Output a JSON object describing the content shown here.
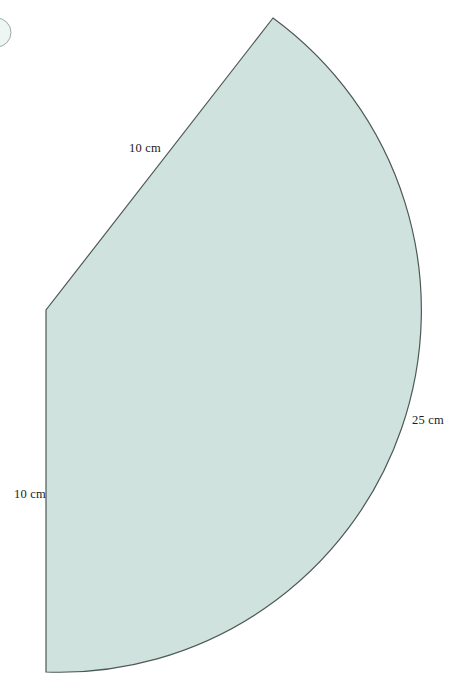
{
  "diagram": {
    "labels": {
      "slant_edge": "10 cm",
      "left_edge": "10 cm",
      "arc": "25 cm"
    },
    "colors": {
      "background": "#ffffff",
      "shape_fill": "#cfe2de",
      "shape_stroke": "#4e5956",
      "bubble_fill": "#eef6f3",
      "bubble_stroke": "#9aaaa6",
      "label_text": "#1c1c1c"
    }
  }
}
